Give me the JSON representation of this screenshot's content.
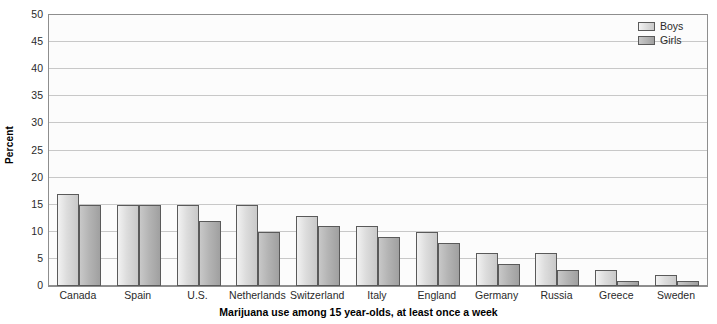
{
  "chart_data": {
    "type": "bar",
    "title": "",
    "xlabel": "Marijuana use among 15 year-olds, at least once a week",
    "ylabel": "Percent",
    "ylim": [
      0,
      50
    ],
    "ytick_step": 5,
    "yticks": [
      0,
      5,
      10,
      15,
      20,
      25,
      30,
      35,
      40,
      45,
      50
    ],
    "ytick_labels": [
      "0",
      "5",
      "10",
      "15",
      "20",
      "25",
      "30",
      "35",
      "40",
      "45",
      "50"
    ],
    "grid": true,
    "legend_position": "top-right",
    "categories": [
      "Canada",
      "Spain",
      "U.S.",
      "Netherlands",
      "Switzerland",
      "Italy",
      "England",
      "Germany",
      "Russia",
      "Greece",
      "Sweden"
    ],
    "series": [
      {
        "name": "Boys",
        "color": "#dcdcdc",
        "values": [
          17,
          15,
          15,
          15,
          13,
          11,
          10,
          6,
          6,
          3,
          2
        ]
      },
      {
        "name": "Girls",
        "color": "#b4b4b4",
        "values": [
          15,
          15,
          12,
          10,
          11,
          9,
          8,
          4,
          3,
          1,
          1
        ]
      }
    ]
  },
  "colors": {
    "plot_background": "#fcfcfc",
    "axis_line": "#8e8e8e",
    "gridline": "#c8c8c8",
    "bar_outline": "#5a5a5a",
    "text": "#2a2a2a"
  }
}
